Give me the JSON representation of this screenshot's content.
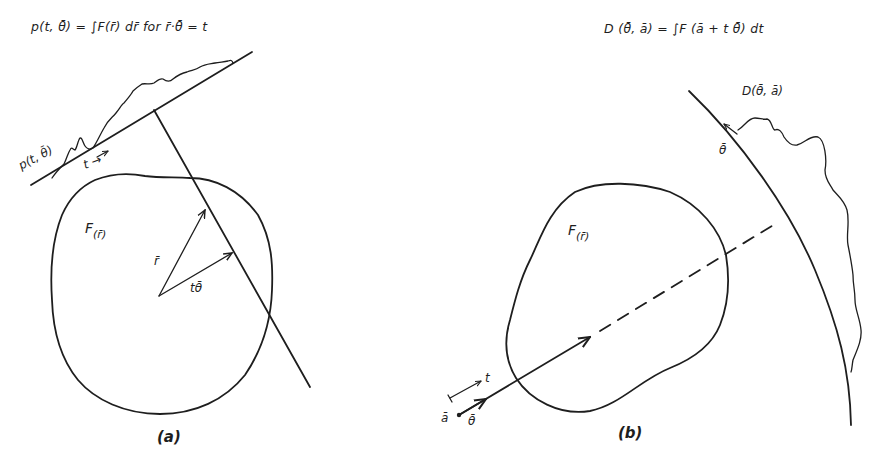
{
  "panel_a": {
    "equation": "p(t, θ̄) = ∫F(r̄) dr̄  for  r̄·θ̄ = t",
    "profile_label": "p(t, θ̄)",
    "t_label": "t →",
    "object_label": "F",
    "object_subscript": "(r̄)",
    "vector_r_label": "r̄",
    "vector_t_theta_label": "tθ̄",
    "caption": "(a)"
  },
  "panel_b": {
    "equation": "D (θ̄, ā) = ∫F (ā + t θ̄) dt",
    "profile_label": "D(θ̄, ā)",
    "theta_arrow_label": "θ̄",
    "object_label": "F",
    "object_subscript": "(r̄)",
    "t_label": "t",
    "point_a_label": "ā",
    "direction_label": "θ̄",
    "caption": "(b)"
  },
  "colors": {
    "ink": "#1e1e1e",
    "background": "#ffffff"
  }
}
